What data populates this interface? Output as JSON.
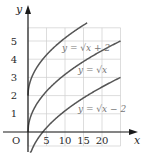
{
  "chart_data": {
    "type": "line",
    "title": "",
    "xlabel": "x",
    "ylabel": "y",
    "origin_label": "O",
    "xlim": [
      0,
      26
    ],
    "ylim": [
      -0.7,
      6
    ],
    "grid": true,
    "x_ticks": [
      5,
      10,
      15,
      20
    ],
    "x_tick_labels": [
      "5",
      "10",
      "15",
      "20"
    ],
    "y_ticks": [
      1,
      2,
      3,
      4,
      5
    ],
    "y_tick_labels": [
      "1",
      "2",
      "3",
      "4",
      "5"
    ],
    "series": [
      {
        "name": "y = √x + 2",
        "label": "y = √x + 2",
        "function": "sqrt(x) + 2",
        "x_range": [
          0,
          16
        ],
        "color": "#555555"
      },
      {
        "name": "y = √x",
        "label": "y = √x",
        "function": "sqrt(x)",
        "x_range": [
          0,
          25
        ],
        "color": "#555555"
      },
      {
        "name": "y = √x − 2",
        "label": "y = √x − 2",
        "function": "sqrt(x) - 2",
        "x_range": [
          0,
          25
        ],
        "color": "#555555"
      }
    ],
    "colors": {
      "axis": "#1a1a1a",
      "grid": "#cfcfcf",
      "curve": "#555555"
    }
  }
}
